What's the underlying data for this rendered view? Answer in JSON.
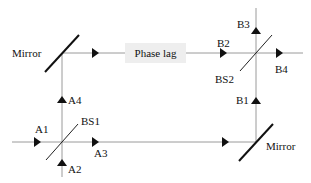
{
  "diagram": {
    "colors": {
      "beam": "#9a9a9a",
      "optic": "#111111",
      "phase_box_bg": "#eeeeee"
    },
    "components": {
      "mirror_top_left": "Mirror",
      "mirror_bottom_right": "Mirror",
      "beam_splitter_1": "BS1",
      "beam_splitter_2": "BS2",
      "phase_lag": "Phase lag"
    },
    "ports": {
      "a1": "A1",
      "a2": "A2",
      "a3": "A3",
      "a4": "A4",
      "b1": "B1",
      "b2": "B2",
      "b3": "B3",
      "b4": "B4"
    }
  }
}
